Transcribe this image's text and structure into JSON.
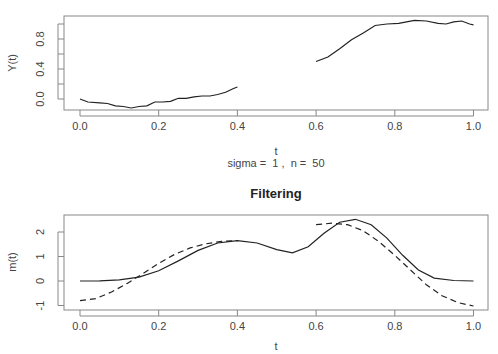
{
  "chart_data": [
    {
      "type": "line",
      "title": "",
      "xlabel": "t",
      "ylabel": "Y(t)",
      "subtitle": "sigma =  1 ,  n =  50",
      "xlim": [
        0,
        1
      ],
      "ylim": [
        -0.1,
        1.05
      ],
      "xticks": [
        "0.0",
        "0.2",
        "0.4",
        "0.6",
        "0.8",
        "1.0"
      ],
      "yticks": [
        "0.0",
        "0.4",
        "0.8"
      ],
      "series": [
        {
          "name": "Y(t) segment 1",
          "style": "solid",
          "x": [
            0,
            0.02,
            0.05,
            0.07,
            0.09,
            0.11,
            0.13,
            0.15,
            0.17,
            0.19,
            0.21,
            0.23,
            0.25,
            0.27,
            0.29,
            0.31,
            0.33,
            0.35,
            0.37,
            0.39,
            0.4
          ],
          "y": [
            0,
            -0.04,
            -0.05,
            -0.06,
            -0.09,
            -0.1,
            -0.12,
            -0.1,
            -0.09,
            -0.04,
            -0.04,
            -0.03,
            0.01,
            0.01,
            0.03,
            0.04,
            0.04,
            0.06,
            0.09,
            0.14,
            0.16
          ]
        },
        {
          "name": "Y(t) segment 2",
          "style": "solid",
          "x": [
            0.6,
            0.63,
            0.66,
            0.69,
            0.72,
            0.75,
            0.78,
            0.81,
            0.83,
            0.85,
            0.88,
            0.91,
            0.93,
            0.95,
            0.97,
            0.99,
            1.0
          ],
          "y": [
            0.5,
            0.56,
            0.67,
            0.79,
            0.88,
            0.98,
            1.0,
            1.01,
            1.03,
            1.05,
            1.04,
            1.01,
            1.0,
            1.03,
            1.04,
            1.0,
            0.99
          ]
        }
      ]
    },
    {
      "type": "line",
      "title": "Filtering",
      "xlabel": "t",
      "ylabel": "m(t)",
      "xlim": [
        0,
        1
      ],
      "ylim": [
        -1.15,
        2.7
      ],
      "xticks": [
        "0.0",
        "0.2",
        "0.4",
        "0.6",
        "0.8",
        "1.0"
      ],
      "yticks": [
        "-1",
        "0",
        "1",
        "2"
      ],
      "series": [
        {
          "name": "true m(t)",
          "style": "solid",
          "x": [
            0,
            0.05,
            0.1,
            0.15,
            0.2,
            0.25,
            0.3,
            0.35,
            0.4,
            0.45,
            0.5,
            0.54,
            0.58,
            0.62,
            0.66,
            0.7,
            0.74,
            0.78,
            0.82,
            0.86,
            0.9,
            0.95,
            1.0
          ],
          "y": [
            0,
            0.01,
            0.05,
            0.16,
            0.42,
            0.82,
            1.25,
            1.55,
            1.65,
            1.55,
            1.28,
            1.15,
            1.4,
            1.95,
            2.4,
            2.52,
            2.3,
            1.75,
            1.05,
            0.45,
            0.12,
            0.02,
            0
          ]
        },
        {
          "name": "filtered estimate (part 1)",
          "style": "dashed",
          "x": [
            0,
            0.04,
            0.08,
            0.12,
            0.16,
            0.2,
            0.24,
            0.28,
            0.32,
            0.36,
            0.4
          ],
          "y": [
            -0.8,
            -0.72,
            -0.45,
            -0.1,
            0.3,
            0.72,
            1.08,
            1.35,
            1.52,
            1.62,
            1.65
          ]
        },
        {
          "name": "filtered estimate (part 2)",
          "style": "dashed",
          "x": [
            0.6,
            0.64,
            0.68,
            0.72,
            0.76,
            0.8,
            0.84,
            0.88,
            0.92,
            0.96,
            1.0
          ],
          "y": [
            2.3,
            2.36,
            2.3,
            2.05,
            1.6,
            1.05,
            0.45,
            -0.15,
            -0.6,
            -0.88,
            -1.02
          ]
        }
      ]
    }
  ]
}
